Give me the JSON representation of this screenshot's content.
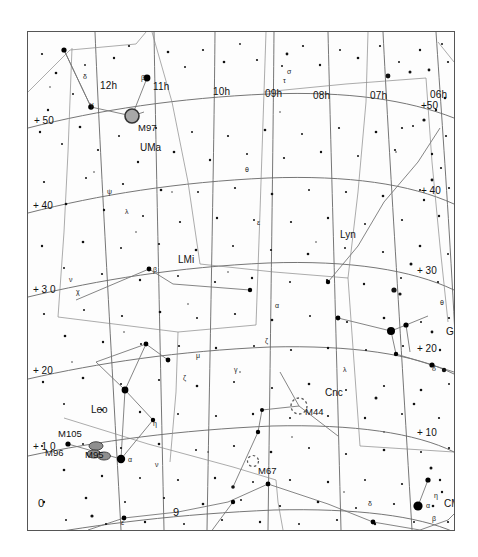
{
  "chart_data": {
    "type": "scatter",
    "title": "",
    "subtitle": "",
    "xlabel": "Right Ascension",
    "ylabel": "Declination",
    "projection": "equatorial star chart",
    "xlim": [
      12.6,
      5.6
    ],
    "ylim": [
      -5,
      57
    ],
    "grid": true,
    "legend": "none",
    "ra_ticks": [
      {
        "label": "12h",
        "hours": 12,
        "x": 77,
        "y": 54
      },
      {
        "label": "11h",
        "hours": 11,
        "x": 131,
        "y": 55
      },
      {
        "label": "10h",
        "hours": 10,
        "x": 192,
        "y": 60
      },
      {
        "label": "09h",
        "hours": 9,
        "x": 243,
        "y": 62
      },
      {
        "label": "08h",
        "hours": 8,
        "x": 291,
        "y": 64
      },
      {
        "label": "07h",
        "hours": 7,
        "x": 348,
        "y": 64
      },
      {
        "label": "06h",
        "hours": 6,
        "x": 411,
        "y": 63
      }
    ],
    "dec_ticks_left": [
      {
        "label": "+ 50",
        "dec": 50,
        "x": 34,
        "y": 89
      },
      {
        "label": "+ 40",
        "dec": 40,
        "x": 33,
        "y": 174
      },
      {
        "label": "+ 3 0",
        "dec": 30,
        "x": 33,
        "y": 258
      },
      {
        "label": "+ 20",
        "dec": 20,
        "x": 33,
        "y": 339
      },
      {
        "label": "+ 1 0",
        "dec": 10,
        "x": 33,
        "y": 415
      },
      {
        "label": "0",
        "dec": 0,
        "x": 37,
        "y": 500
      }
    ],
    "dec_ticks_right": [
      {
        "label": "+50",
        "dec": 50,
        "x": 424,
        "y": 104
      },
      {
        "label": "+ 40",
        "dec": 40,
        "x": 424,
        "y": 188
      },
      {
        "label": "+ 30",
        "dec": 30,
        "x": 419,
        "y": 268
      },
      {
        "label": "+ 20",
        "dec": 20,
        "x": 424,
        "y": 345
      },
      {
        "label": "+ 10",
        "dec": 10,
        "x": 424,
        "y": 430
      }
    ],
    "interior_ra_label": {
      "label": "9",
      "x": 150,
      "y": 482
    },
    "constellations": [
      {
        "abbr": "UMa",
        "name": "Ursa Major",
        "x": 120,
        "y": 116
      },
      {
        "abbr": "LMi",
        "name": "Leo Minor",
        "x": 157,
        "y": 229
      },
      {
        "abbr": "Lyn",
        "name": "Lynx",
        "x": 320,
        "y": 204
      },
      {
        "abbr": "Leo",
        "name": "Leo",
        "x": 71,
        "y": 379
      },
      {
        "abbr": "Cnc",
        "name": "Cancer",
        "x": 305,
        "y": 362
      },
      {
        "abbr": "Gem",
        "name": "Gemini",
        "x": 426,
        "y": 301
      },
      {
        "abbr": "CMi",
        "name": "Canis Minor",
        "x": 424,
        "y": 473
      }
    ],
    "deep_sky_objects": [
      {
        "id": "M97",
        "type": "planetary-nebula",
        "x": 104,
        "y": 84,
        "label_x": 113,
        "label_y": 96,
        "size": 14
      },
      {
        "id": "M105",
        "type": "galaxy",
        "x": 68,
        "y": 414,
        "label_x": 38,
        "label_y": 404,
        "size": 12
      },
      {
        "id": "M96",
        "type": "galaxy",
        "x": 66,
        "y": 421,
        "label_x": 24,
        "label_y": 422,
        "size": 11
      },
      {
        "id": "M95",
        "type": "galaxy",
        "x": 73,
        "y": 424,
        "label_x": 62,
        "label_y": 424,
        "size": 11
      },
      {
        "id": "M44",
        "type": "open-cluster",
        "x": 271,
        "y": 374,
        "label_x": 281,
        "label_y": 381,
        "size": 16
      },
      {
        "id": "M67",
        "type": "open-cluster",
        "x": 225,
        "y": 429,
        "label_x": 233,
        "label_y": 440,
        "size": 11
      }
    ],
    "bright_stars": [
      {
        "name": "alpha-leo-regulus",
        "greek": "α",
        "x": 93,
        "y": 427,
        "mag": 1.4
      },
      {
        "name": "alpha-cmi-procyon",
        "greek": "α",
        "x": 390,
        "y": 474,
        "mag": 0.4
      },
      {
        "name": "beta-gem-pollux",
        "greek": "β",
        "x": 363,
        "y": 299,
        "mag": 1.1
      },
      {
        "name": "alpha-gem-castor",
        "greek": "α",
        "x": 378,
        "y": 293,
        "mag": 1.6
      },
      {
        "name": "beta-uma-merak",
        "greek": "β",
        "x": 119,
        "y": 46,
        "mag": 2.3
      },
      {
        "name": "gamma-uma-phecda",
        "greek": "γ",
        "x": 63,
        "y": 75,
        "mag": 2.4
      },
      {
        "name": "delta-leo-zosma",
        "greek": "δ",
        "x": 97,
        "y": 358,
        "mag": 2.5
      },
      {
        "name": "beta-lmi",
        "greek": "β",
        "x": 121,
        "y": 237,
        "mag": 4.2
      }
    ],
    "star_greek_labels": [
      {
        "g": "δ",
        "x": 55,
        "y": 41
      },
      {
        "g": "γ",
        "x": 62,
        "y": 69
      },
      {
        "g": "β",
        "x": 113,
        "y": 42
      },
      {
        "g": "ψ",
        "x": 79,
        "y": 156
      },
      {
        "g": "λ",
        "x": 97,
        "y": 176
      },
      {
        "g": "ν",
        "x": 41,
        "y": 244
      },
      {
        "g": "χ",
        "x": 48,
        "y": 256
      },
      {
        "g": "β",
        "x": 125,
        "y": 234
      },
      {
        "g": "τ",
        "x": 255,
        "y": 45
      },
      {
        "g": "σ",
        "x": 259,
        "y": 36
      },
      {
        "g": "θ",
        "x": 217,
        "y": 134
      },
      {
        "g": "ε",
        "x": 229,
        "y": 187
      },
      {
        "g": "α",
        "x": 247,
        "y": 270
      },
      {
        "g": "ζ",
        "x": 237,
        "y": 305
      },
      {
        "g": "μ",
        "x": 168,
        "y": 320
      },
      {
        "g": "ζ",
        "x": 155,
        "y": 342
      },
      {
        "g": "γ",
        "x": 206,
        "y": 334
      },
      {
        "g": "η",
        "x": 125,
        "y": 388
      },
      {
        "g": "α",
        "x": 100,
        "y": 424
      },
      {
        "g": "ν",
        "x": 127,
        "y": 429
      },
      {
        "g": "λ",
        "x": 315,
        "y": 334
      },
      {
        "g": "θ",
        "x": 412,
        "y": 267
      },
      {
        "g": "δ",
        "x": 404,
        "y": 333
      },
      {
        "g": "α",
        "x": 398,
        "y": 470
      },
      {
        "g": "η",
        "x": 406,
        "y": 460
      },
      {
        "g": "β",
        "x": 404,
        "y": 483
      },
      {
        "g": "δ",
        "x": 340,
        "y": 468
      },
      {
        "g": "ε",
        "x": 93,
        "y": 487
      },
      {
        "g": "α",
        "x": 251,
        "y": 511
      },
      {
        "g": "σ",
        "x": 345,
        "y": 504
      }
    ],
    "data_point_count": 620
  },
  "chart": {
    "ra_labels": [
      "12h",
      "11h",
      "10h",
      "09h",
      "08h",
      "07h",
      "06h"
    ],
    "dec_labels_left": [
      "+ 50",
      "+ 40",
      "+ 3 0",
      "+ 20",
      "+ 1 0",
      "0"
    ],
    "dec_labels_right": [
      "+50",
      "+ 40",
      "+ 30",
      "+ 20",
      "+ 10"
    ],
    "interior_label": "9",
    "constellation_labels": [
      "UMa",
      "LMi",
      "Lyn",
      "Leo",
      "Cnc",
      "Gem",
      "CMi"
    ],
    "object_labels": [
      "M97",
      "M105",
      "M96",
      "M95",
      "M44",
      "M67"
    ],
    "colors": {
      "background": "#fdfdfd",
      "border": "#555555",
      "star": "#000000",
      "gridline": "#666666",
      "constellation_line": "#777777",
      "nebula_fill": "#a8a8a8",
      "galaxy_fill": "#8f8f8f",
      "text": "#111111"
    }
  }
}
